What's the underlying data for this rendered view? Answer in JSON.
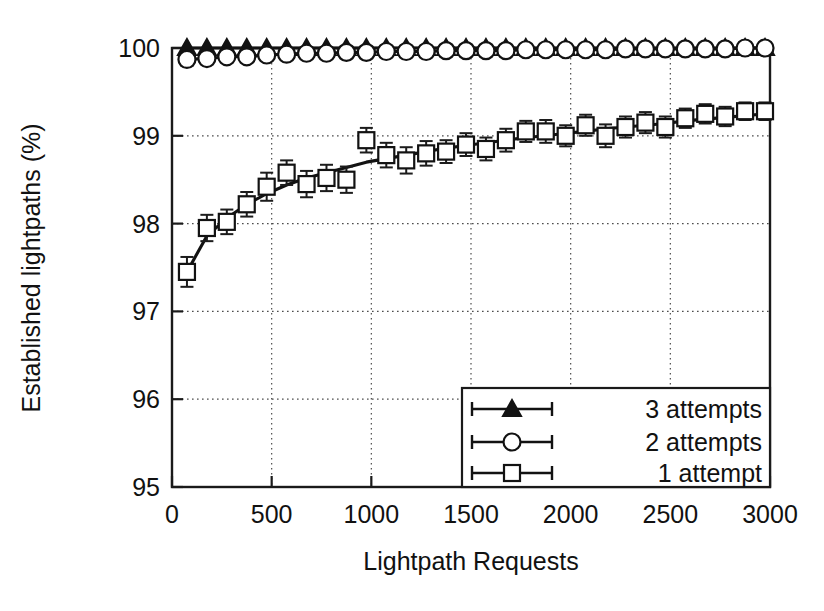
{
  "chart_data": {
    "type": "line",
    "title": "",
    "xlabel": "Lightpath Requests",
    "ylabel": "Established lightpaths (%)",
    "xlim": [
      0,
      3000
    ],
    "ylim": [
      95,
      100
    ],
    "xticks": [
      0,
      500,
      1000,
      1500,
      2000,
      2500,
      3000
    ],
    "xtick_labels": [
      "0",
      "500",
      "1000",
      "1500",
      "2000",
      "2500",
      "3000"
    ],
    "yticks": [
      95,
      96,
      97,
      98,
      99,
      100
    ],
    "ytick_labels": [
      "95",
      "96",
      "97",
      "98",
      "99",
      "100"
    ],
    "grid": "dotted-both-axes",
    "legend_position": "lower-right-inside",
    "error_bars": true,
    "x": [
      75,
      175,
      275,
      375,
      475,
      575,
      675,
      775,
      875,
      975,
      1075,
      1175,
      1275,
      1375,
      1475,
      1575,
      1675,
      1775,
      1875,
      1975,
      2075,
      2175,
      2275,
      2375,
      2475,
      2575,
      2675,
      2775,
      2875,
      2975
    ],
    "series": [
      {
        "name": "3 attempts",
        "marker": "triangle-filled",
        "values": [
          100.0,
          100.0,
          100.0,
          100.0,
          100.0,
          100.0,
          100.0,
          100.0,
          100.0,
          100.0,
          100.0,
          100.0,
          100.0,
          100.0,
          100.0,
          100.0,
          100.0,
          100.0,
          100.0,
          100.0,
          100.0,
          100.0,
          100.0,
          100.0,
          100.0,
          100.0,
          100.0,
          100.0,
          100.0,
          100.0
        ],
        "errors": [
          0.02,
          0.02,
          0.015,
          0.015,
          0.012,
          0.012,
          0.01,
          0.01,
          0.01,
          0.008,
          0.008,
          0.008,
          0.007,
          0.007,
          0.006,
          0.006,
          0.006,
          0.005,
          0.005,
          0.005,
          0.004,
          0.004,
          0.004,
          0.004,
          0.003,
          0.003,
          0.003,
          0.003,
          0.002,
          0.002
        ]
      },
      {
        "name": "2 attempts",
        "marker": "circle-open",
        "values": [
          99.87,
          99.88,
          99.9,
          99.9,
          99.92,
          99.93,
          99.94,
          99.94,
          99.95,
          99.95,
          99.96,
          99.96,
          99.96,
          99.97,
          99.97,
          99.97,
          99.97,
          99.98,
          99.98,
          99.98,
          99.98,
          99.98,
          99.99,
          99.99,
          99.99,
          99.99,
          99.99,
          99.99,
          100.0,
          100.0
        ],
        "errors": [
          0.07,
          0.06,
          0.055,
          0.05,
          0.045,
          0.04,
          0.04,
          0.035,
          0.035,
          0.03,
          0.03,
          0.028,
          0.027,
          0.025,
          0.024,
          0.023,
          0.022,
          0.021,
          0.02,
          0.02,
          0.018,
          0.018,
          0.017,
          0.016,
          0.015,
          0.015,
          0.014,
          0.013,
          0.012,
          0.012
        ]
      },
      {
        "name": "1 attempt",
        "marker": "square-open",
        "values": [
          97.45,
          97.95,
          98.02,
          98.22,
          98.42,
          98.58,
          98.45,
          98.52,
          98.5,
          98.95,
          98.78,
          98.72,
          98.8,
          98.82,
          98.9,
          98.85,
          98.95,
          99.05,
          99.05,
          99.0,
          99.12,
          99.0,
          99.1,
          99.15,
          99.1,
          99.2,
          99.25,
          99.22,
          99.28,
          99.28
        ],
        "errors": [
          0.17,
          0.15,
          0.14,
          0.14,
          0.16,
          0.14,
          0.15,
          0.15,
          0.15,
          0.14,
          0.14,
          0.15,
          0.14,
          0.13,
          0.13,
          0.13,
          0.13,
          0.12,
          0.13,
          0.12,
          0.12,
          0.13,
          0.12,
          0.12,
          0.12,
          0.11,
          0.11,
          0.11,
          0.1,
          0.1
        ]
      }
    ],
    "fit_curve": {
      "name": "1 attempt smooth fit",
      "x": [
        75,
        175,
        275,
        375,
        475,
        575,
        675,
        775,
        875,
        975,
        1075,
        1175,
        1275,
        1375,
        1475,
        1575,
        1675,
        1775,
        1875,
        1975,
        2075,
        2175,
        2275,
        2375,
        2475,
        2575,
        2675,
        2775,
        2875,
        2975
      ],
      "values": [
        97.45,
        97.86,
        98.06,
        98.22,
        98.34,
        98.44,
        98.52,
        98.58,
        98.64,
        98.7,
        98.74,
        98.78,
        98.82,
        98.86,
        98.89,
        98.92,
        98.95,
        98.98,
        99.0,
        99.03,
        99.05,
        99.08,
        99.1,
        99.12,
        99.14,
        99.17,
        99.19,
        99.21,
        99.23,
        99.25
      ]
    }
  },
  "legend": {
    "entries": [
      {
        "label": "3 attempts",
        "marker": "triangle-filled"
      },
      {
        "label": "2 attempts",
        "marker": "circle-open"
      },
      {
        "label": "1 attempt",
        "marker": "square-open"
      }
    ]
  },
  "colors": {
    "line": "#121212",
    "marker_fill": "#ffffff",
    "grid": "#4d4d4d",
    "frame": "#1a1a1a",
    "background": "#ffffff"
  }
}
